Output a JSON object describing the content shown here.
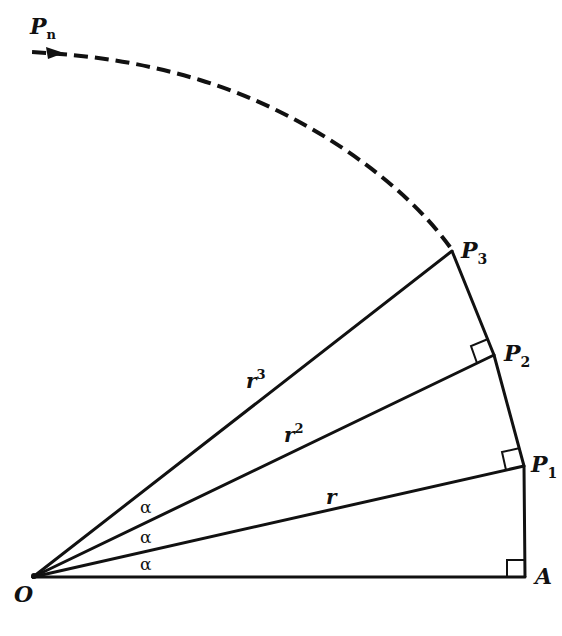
{
  "diagram": {
    "stroke_color": "#111111",
    "background": "#ffffff",
    "points": {
      "O": {
        "label": "O",
        "sub": ""
      },
      "A": {
        "label": "A",
        "sub": ""
      },
      "P1": {
        "label": "P",
        "sub": "1"
      },
      "P2": {
        "label": "P",
        "sub": "2"
      },
      "P3": {
        "label": "P",
        "sub": "3"
      },
      "Pn": {
        "label": "P",
        "sub": "n"
      }
    },
    "segment_labels": {
      "r1": {
        "base": "r",
        "exp": ""
      },
      "r2": {
        "base": "r",
        "exp": "2"
      },
      "r3": {
        "base": "r",
        "exp": "3"
      }
    },
    "angle_labels": [
      "α",
      "α",
      "α"
    ],
    "right_angles": [
      "A",
      "P1",
      "P2"
    ]
  }
}
